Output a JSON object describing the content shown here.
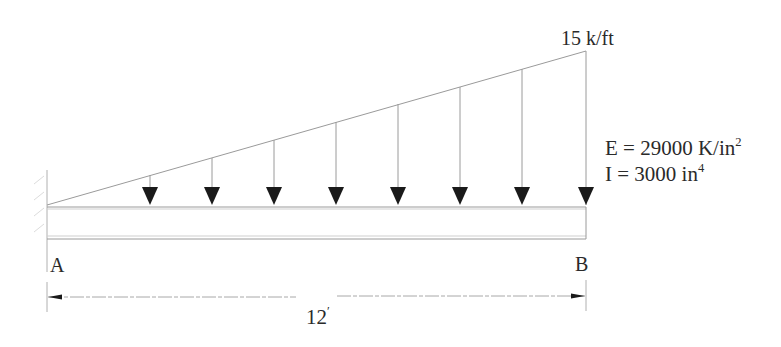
{
  "diagram": {
    "type": "beam-loading",
    "support": "fixed-cantilever-at-A",
    "load": {
      "kind": "linearly-varying-distributed",
      "start_value": 0,
      "max_label": "15 k/ft",
      "arrow_count": 8
    },
    "properties": {
      "e_prefix": "E = 29000 K/in",
      "e_exp": "2",
      "i_prefix": "I = 3000 in",
      "i_exp": "4"
    },
    "points": {
      "a": "A",
      "b": "B"
    },
    "dimension": {
      "span_value": "12",
      "span_unit_mark": "′"
    },
    "colors": {
      "line": "#9a9a9a",
      "arrowhead": "#1a1a1a",
      "text": "#2a2a2a"
    }
  }
}
